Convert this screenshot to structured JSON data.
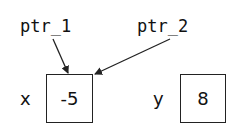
{
  "pointers": [
    {
      "name": "ptr_1",
      "target": "x"
    },
    {
      "name": "ptr_2",
      "target": "x"
    }
  ],
  "variables": [
    {
      "name": "x",
      "value": "-5"
    },
    {
      "name": "y",
      "value": "8"
    }
  ],
  "colors": {
    "stroke": "#222222",
    "text": "#111111",
    "background": "#ffffff"
  }
}
